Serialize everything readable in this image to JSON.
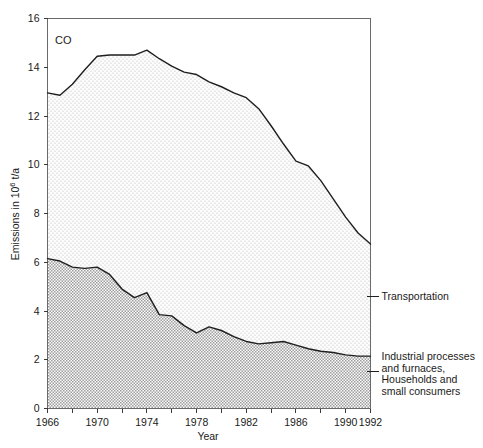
{
  "chart_data": {
    "type": "area",
    "title": "",
    "panel_label": "CO",
    "xlabel": "Year",
    "ylabel": "Emissions in 10⁶ t/a",
    "ylabel_parts": {
      "pre": "Emissions in 10",
      "sup": "6",
      "post": " t/a"
    },
    "xlim": [
      1966,
      1992
    ],
    "ylim": [
      0,
      16
    ],
    "grid": false,
    "legend_position": "right-outside",
    "xticks": [
      1966,
      1968,
      1970,
      1972,
      1974,
      1976,
      1978,
      1980,
      1982,
      1984,
      1986,
      1988,
      1990,
      1992
    ],
    "xticklabels": [
      "1966",
      "",
      "1970",
      "",
      "1974",
      "",
      "1978",
      "",
      "1982",
      "",
      "1986",
      "",
      "1990",
      "1992"
    ],
    "yticks": [
      0,
      2,
      4,
      6,
      8,
      10,
      12,
      14,
      16
    ],
    "yticklabels": [
      "0",
      "2",
      "4",
      "6",
      "8",
      "10",
      "12",
      "14",
      "16"
    ],
    "x": [
      1966,
      1967,
      1968,
      1969,
      1970,
      1971,
      1972,
      1973,
      1974,
      1975,
      1976,
      1977,
      1978,
      1979,
      1980,
      1981,
      1982,
      1983,
      1984,
      1985,
      1986,
      1987,
      1988,
      1989,
      1990,
      1991,
      1992
    ],
    "series": [
      {
        "name": "Industrial processes and furnaces, Households and small consumers",
        "label_lines": [
          "Industrial processes",
          "and furnaces,",
          "Households and",
          "small consumers"
        ],
        "stack_order": 1,
        "fill": "#d2d2d2",
        "values": [
          6.15,
          6.05,
          5.8,
          5.75,
          5.8,
          5.5,
          4.9,
          4.55,
          4.75,
          3.85,
          3.8,
          3.4,
          3.1,
          3.35,
          3.2,
          2.95,
          2.75,
          2.65,
          2.7,
          2.75,
          2.6,
          2.45,
          2.35,
          2.3,
          2.2,
          2.15,
          2.15
        ]
      },
      {
        "name": "Transportation",
        "label_lines": [
          "Transportation"
        ],
        "stack_order": 2,
        "fill": "#efefef",
        "cumulative_values": [
          12.95,
          12.85,
          13.3,
          13.9,
          14.45,
          14.5,
          14.5,
          14.5,
          14.7,
          14.35,
          14.05,
          13.8,
          13.7,
          13.4,
          13.2,
          12.95,
          12.75,
          12.3,
          11.6,
          10.85,
          10.15,
          9.95,
          9.35,
          8.6,
          7.85,
          7.2,
          6.75
        ]
      }
    ],
    "total_label": "total = Transportation + Industrial processes and furnaces, Households and small consumers",
    "annotations": [
      {
        "name": "transportation-callout",
        "text": "Transportation",
        "at_value": 4.6
      },
      {
        "name": "industrial-callout",
        "text": "Industrial processes and furnaces, Households and small consumers",
        "at_value": 1.5
      }
    ]
  },
  "axes": {
    "x_title": "Year",
    "panel_tag": "CO"
  }
}
